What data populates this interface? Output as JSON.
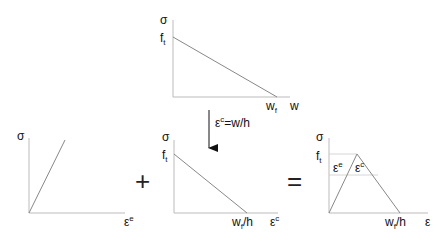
{
  "diagram": {
    "top_graph": {
      "y_label": "σ",
      "x_label": "w",
      "y_tick": {
        "base": "f",
        "sub": "t"
      },
      "x_tick": {
        "base": "w",
        "sub": "f"
      }
    },
    "transform": {
      "eps": "ε",
      "sup": "c",
      "rest": "=w/h"
    },
    "left_graph": {
      "y_label": "σ",
      "x_label": {
        "base": "ε",
        "sup": "e"
      }
    },
    "plus": "+",
    "middle_graph": {
      "y_label": "σ",
      "x_label": {
        "base": "ε",
        "sup": "c"
      },
      "y_tick": {
        "base": "f",
        "sub": "t"
      },
      "x_tick": {
        "base": "w",
        "sub": "f",
        "rest": "/h"
      }
    },
    "equals": "=",
    "right_graph": {
      "y_label": "σ",
      "x_label": "ε",
      "y_tick": {
        "base": "f",
        "sub": "t"
      },
      "x_tick": {
        "base": "w",
        "sub": "f",
        "rest": "/h"
      },
      "inner_e": {
        "base": "ε",
        "sup": "e"
      },
      "inner_c": {
        "base": "ε",
        "sup": "c"
      }
    }
  }
}
